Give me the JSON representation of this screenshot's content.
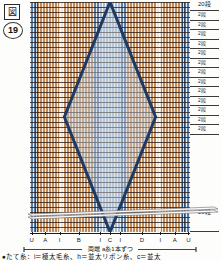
{
  "figure": {
    "box_marker": "図",
    "number": "19",
    "kind": "weaving-draft"
  },
  "scale": {
    "top_label": "20段",
    "bottom_label": "20段",
    "tick_labels": [
      "2段",
      "2段",
      "2段",
      "2段",
      "2段",
      "2段",
      "2段",
      "2段",
      "2段",
      "2段",
      "2段",
      "2段",
      "2段"
    ]
  },
  "axis": {
    "labels": [
      "U",
      "A",
      "I",
      "B",
      "I",
      "C",
      "I",
      "D",
      "I",
      "A",
      "U"
    ],
    "positions_pct": [
      1,
      9.5,
      18.5,
      30.5,
      44,
      50,
      56.5,
      70,
      81.5,
      90.5,
      99
    ]
  },
  "measure_note": "両端  a糸1本ずつ",
  "caption": "●たて糸：i＝極太毛糸、h＝並太リボン糸、c＝並太",
  "colors": {
    "warp_orange": "#c08a5a",
    "warp_orange_light": "#d9a877",
    "warp_cream": "#efe6d8",
    "warp_white": "#fdfbf7",
    "warp_blue": "#5c7da3",
    "warp_blue_dark": "#2c4a70",
    "warp_blue_pale": "#aebed2",
    "motif_outline": "#1e3a63",
    "weft_line": "#3a2a1c",
    "rule": "#1c1c1c"
  },
  "chart_data": {
    "type": "heatmap",
    "xlabel": "",
    "ylabel": "段",
    "grid": true,
    "legend": "none",
    "x_tick_labels": [
      "U",
      "A",
      "I",
      "B",
      "I",
      "C",
      "I",
      "D",
      "I",
      "A",
      "U"
    ],
    "y_tick_labels": [
      "20段",
      "2段",
      "2段",
      "2段",
      "2段",
      "2段",
      "2段",
      "2段",
      "2段",
      "2段",
      "2段",
      "2段",
      "2段",
      "2段",
      "20段"
    ],
    "warp_bands": [
      {
        "x": 0.0,
        "w": 0.03,
        "color": "#5c7da3",
        "name": "U"
      },
      {
        "x": 0.03,
        "w": 0.02,
        "color": "#2c4a70",
        "name": "edge"
      },
      {
        "x": 0.05,
        "w": 0.13,
        "color": "#c08a5a",
        "name": "A"
      },
      {
        "x": 0.18,
        "w": 0.035,
        "color": "#efe6d8",
        "name": "I"
      },
      {
        "x": 0.215,
        "w": 0.185,
        "color": "#c08a5a",
        "name": "B"
      },
      {
        "x": 0.4,
        "w": 0.04,
        "color": "#5c7da3",
        "name": "I"
      },
      {
        "x": 0.44,
        "w": 0.12,
        "color": "#aebed2",
        "name": "C"
      },
      {
        "x": 0.56,
        "w": 0.04,
        "color": "#5c7da3",
        "name": "I"
      },
      {
        "x": 0.6,
        "w": 0.185,
        "color": "#c08a5a",
        "name": "D"
      },
      {
        "x": 0.785,
        "w": 0.035,
        "color": "#efe6d8",
        "name": "I"
      },
      {
        "x": 0.82,
        "w": 0.13,
        "color": "#c08a5a",
        "name": "A"
      },
      {
        "x": 0.95,
        "w": 0.02,
        "color": "#2c4a70",
        "name": "edge"
      },
      {
        "x": 0.97,
        "w": 0.03,
        "color": "#5c7da3",
        "name": "U"
      }
    ],
    "motif": {
      "shape": "lens-diamond",
      "outline_color": "#1e3a63",
      "fill_color": "#c3d0de",
      "apex_top_x": 0.5,
      "apex_top_y": 0.0,
      "apex_bottom_x": 0.5,
      "apex_bottom_y": 1.0,
      "max_width_y": 0.5,
      "max_half_width": 0.285
    },
    "rows": 40,
    "columns": 64
  }
}
